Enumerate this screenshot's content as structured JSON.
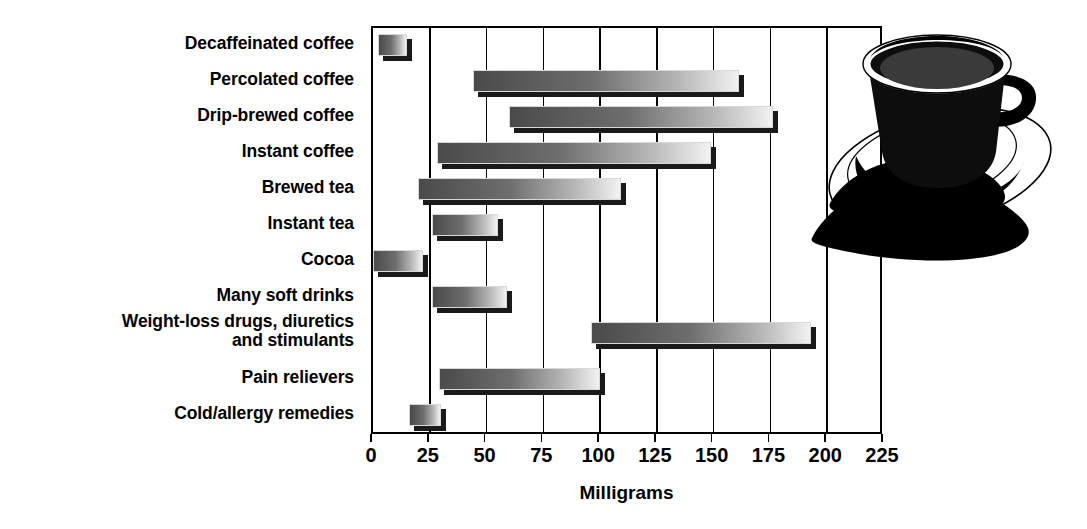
{
  "chart_data": {
    "type": "bar",
    "orientation": "horizontal",
    "title": "",
    "subtitle": "",
    "xlabel": "Milligrams",
    "ylabel": "",
    "xlim": [
      0,
      225
    ],
    "xticks": [
      0,
      25,
      50,
      75,
      100,
      125,
      150,
      175,
      200,
      225
    ],
    "xticklabels": [
      "0",
      "25",
      "50",
      "75",
      "100",
      "125",
      "150",
      "175",
      "200",
      "225"
    ],
    "grid": "vertical",
    "legend": "none",
    "value_type": "range",
    "categories": [
      "Decaffeinated coffee",
      "Percolated coffee",
      "Drip-brewed coffee",
      "Instant coffee",
      "Brewed tea",
      "Instant tea",
      "Cocoa",
      "Many soft drinks",
      "Weight-loss drugs, diuretics\nand stimulants",
      "Pain relievers",
      "Cold/allergy remedies"
    ],
    "ranges": [
      {
        "category": "Decaffeinated coffee",
        "low": 2,
        "high": 15
      },
      {
        "category": "Percolated coffee",
        "low": 44,
        "high": 161
      },
      {
        "category": "Drip-brewed coffee",
        "low": 60,
        "high": 176
      },
      {
        "category": "Instant coffee",
        "low": 28,
        "high": 149
      },
      {
        "category": "Brewed tea",
        "low": 20,
        "high": 109
      },
      {
        "category": "Instant tea",
        "low": 26,
        "high": 55
      },
      {
        "category": "Cocoa",
        "low": 0,
        "high": 22
      },
      {
        "category": "Many soft drinks",
        "low": 26,
        "high": 59
      },
      {
        "category": "Weight-loss drugs, diuretics and stimulants",
        "low": 96,
        "high": 193
      },
      {
        "category": "Pain relievers",
        "low": 29,
        "high": 100
      },
      {
        "category": "Cold/allergy remedies",
        "low": 16,
        "high": 30
      }
    ]
  },
  "axis": {
    "x_title": "Milligrams"
  },
  "illustration": {
    "name": "coffee-cup-and-saucer",
    "description": "Black coffee cup on saucer with shadow"
  },
  "colors": {
    "bar_dark": "#4a4a4a",
    "bar_light": "#f2f2f2",
    "shadow": "#1a1a1a",
    "axis": "#000000",
    "background": "#ffffff"
  }
}
